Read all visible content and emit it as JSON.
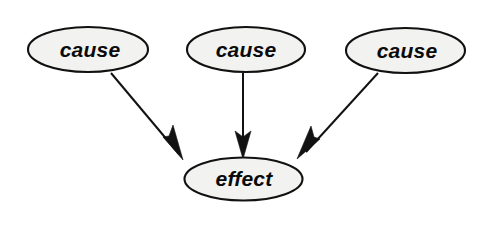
{
  "diagram": {
    "canvas": {
      "width": 482,
      "height": 230,
      "background": "#ffffff"
    },
    "style": {
      "node_fill": "#f2f2f0",
      "node_stroke": "#111111",
      "node_stroke_width": 2.1,
      "edge_color": "#121212",
      "edge_width": 2.0,
      "text_color": "#0a0a0a",
      "font_size": 21
    },
    "nodes": [
      {
        "id": "cause-left",
        "label": "cause",
        "shape": "ellipse",
        "cx": 88,
        "cy": 49.5,
        "rx": 60,
        "ry": 22.5,
        "label_x": 90,
        "label_y": 51
      },
      {
        "id": "cause-middle",
        "label": "cause",
        "shape": "ellipse",
        "cx": 246,
        "cy": 49.5,
        "rx": 59,
        "ry": 22.5,
        "label_x": 246,
        "label_y": 51
      },
      {
        "id": "cause-right",
        "label": "cause",
        "shape": "ellipse",
        "cx": 405.5,
        "cy": 50.5,
        "rx": 59.5,
        "ry": 22.5,
        "label_x": 407,
        "label_y": 52
      },
      {
        "id": "effect",
        "label": "effect",
        "shape": "ellipse",
        "cx": 243.5,
        "cy": 179,
        "rx": 59,
        "ry": 21.5,
        "label_x": 244,
        "label_y": 180
      }
    ],
    "edges": [
      {
        "id": "edge-left",
        "from": "cause-left",
        "to": "effect",
        "x1": 111,
        "y1": 73,
        "x2": 179,
        "y2": 154,
        "head_points": "183,160 163,137 169,136 173,125",
        "direction": "down-right"
      },
      {
        "id": "edge-middle",
        "from": "cause-middle",
        "to": "effect",
        "x1": 243,
        "y1": 73,
        "x2": 243,
        "y2": 150,
        "head_points": "243,159 235,131 243,137 251,131",
        "direction": "down"
      },
      {
        "id": "edge-right",
        "from": "cause-right",
        "to": "effect",
        "x1": 378,
        "y1": 73,
        "x2": 306,
        "y2": 152,
        "head_points": "297,159 320,139 314,137 311,126",
        "direction": "down-left"
      }
    ]
  }
}
